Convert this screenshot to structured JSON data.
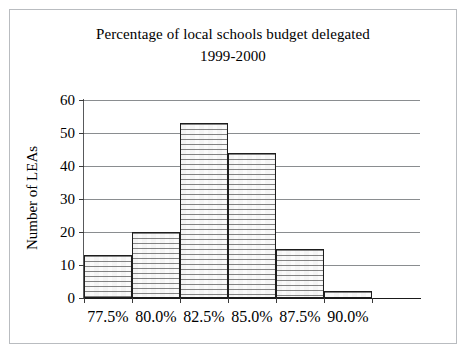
{
  "chart_data": {
    "type": "bar",
    "title": "Percentage of local schools budget delegated",
    "subtitle": "1999-2000",
    "xlabel": "",
    "ylabel": "Number of LEAs",
    "categories": [
      "77.5%",
      "80.0%",
      "82.5%",
      "85.0%",
      "87.5%",
      "90.0%"
    ],
    "values": [
      13,
      20,
      53,
      44,
      15,
      2
    ],
    "ylim": [
      0,
      60
    ],
    "ytick_labels": [
      "0",
      "10",
      "20",
      "30",
      "40",
      "50",
      "60"
    ],
    "ytick_values": [
      0,
      10,
      20,
      30,
      40,
      50,
      60
    ],
    "grid": "horizontal",
    "legend": "none",
    "bar_fill": "#f4f4f4",
    "bar_edge": "#1d1d1d",
    "gridline_color": "#8a8d90",
    "axis_color": "#1a1a1a",
    "background": "#ffffff"
  }
}
